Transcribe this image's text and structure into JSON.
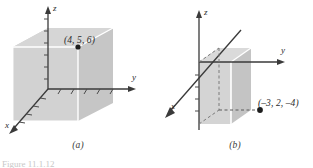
{
  "figure": {
    "type": "math-diagram",
    "background_color": "#ffffff",
    "ink_color": "#2b2b2b",
    "box_fill_light": "#d4d4d4",
    "box_fill_mid": "#c9c9c9",
    "box_fill_dark": "#bfbfbf",
    "edge_highlight": "#ffffff",
    "partial_caption": "Figure 11.1.12"
  },
  "panels": [
    {
      "id": "a",
      "caption": "(a)",
      "axes": {
        "x_label": "x",
        "y_label": "y",
        "z_label": "z"
      },
      "point": {
        "label": "(4, 5, 6)",
        "x": 4,
        "y": 5,
        "z": 6
      },
      "tick_counts": {
        "z_ticks": 6,
        "y_ticks": 5,
        "x_ticks": 4
      }
    },
    {
      "id": "b",
      "caption": "(b)",
      "axes": {
        "x_label": "x",
        "y_label": "y",
        "z_label": "z"
      },
      "point": {
        "label": "(–3, 2, –4)",
        "x": -3,
        "y": 2,
        "z": -4
      },
      "tick_counts": {
        "z_ticks": 4,
        "y_ticks": 0,
        "x_ticks": 0
      }
    }
  ]
}
